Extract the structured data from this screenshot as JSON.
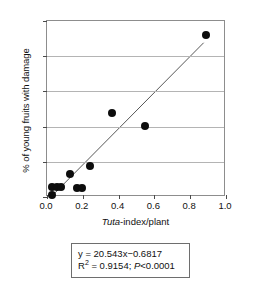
{
  "chart_data": {
    "type": "scatter",
    "title": "",
    "xlabel": "Tuta-index/plant",
    "ylabel": "% of young fruits with damage",
    "xlim": [
      0.0,
      1.0
    ],
    "ylim": [
      0,
      20
    ],
    "grid": "horizontal",
    "legend": "none",
    "xticks": [
      "0.0",
      "0.2",
      "0.4",
      "0.6",
      "0.8",
      "1.0"
    ],
    "xtick_values": [
      0.0,
      0.2,
      0.4,
      0.6,
      0.8,
      1.0
    ],
    "yticks": [
      "0",
      "4",
      "8",
      "12",
      "16",
      "20"
    ],
    "ytick_values": [
      0,
      4,
      8,
      12,
      16,
      20
    ],
    "marker": "filled-circle",
    "marker_color": "#0d0d0d",
    "points": [
      {
        "x": 0.03,
        "y": 0.2
      },
      {
        "x": 0.03,
        "y": 1.1
      },
      {
        "x": 0.055,
        "y": 1.1
      },
      {
        "x": 0.08,
        "y": 1.1
      },
      {
        "x": 0.13,
        "y": 2.6
      },
      {
        "x": 0.17,
        "y": 1.0
      },
      {
        "x": 0.195,
        "y": 1.0
      },
      {
        "x": 0.24,
        "y": 3.5
      },
      {
        "x": 0.365,
        "y": 9.5
      },
      {
        "x": 0.55,
        "y": 8.1
      },
      {
        "x": 0.89,
        "y": 18.4
      }
    ],
    "fit": {
      "type": "linear",
      "slope": 20.543,
      "intercept": -0.6817,
      "color": "#555555",
      "x_start": 0.03,
      "x_end": 0.885
    },
    "annotations": {
      "equation": "y = 20.543x−0.6817",
      "r_squared_label": "R",
      "r_squared_exponent": "2",
      "r_squared_value": " = 0.9154; ",
      "p_label": "P",
      "p_value": "<0.0001"
    }
  },
  "axis": {
    "x_label_italic_part": "Tuta",
    "x_label_rest": "-index/plant",
    "y_label": "% of young fruits with damage"
  }
}
